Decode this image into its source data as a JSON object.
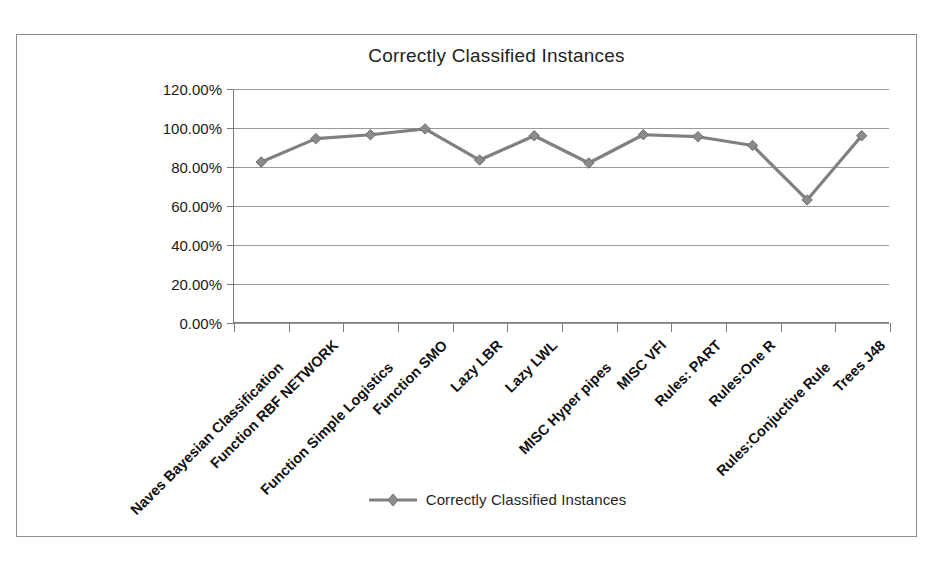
{
  "chart_data": {
    "type": "line",
    "title": "Correctly Classified Instances",
    "xlabel": "",
    "ylabel": "",
    "ylim": [
      0,
      120
    ],
    "ytick_values": [
      120,
      100,
      80,
      60,
      40,
      20,
      0
    ],
    "ytick_labels": [
      "120.00%",
      "100.00%",
      "80.00%",
      "60.00%",
      "40.00%",
      "20.00%",
      "0.00%"
    ],
    "grid": true,
    "legend_position": "bottom",
    "series_color": "#808080",
    "marker": "diamond",
    "categories": [
      "Naves Bayesian Classification",
      "Function RBF NETWORK",
      "Function Simple Logistics",
      "Function SMO",
      "Lazy LBR",
      "Lazy LWL",
      "MISC  Hyper pipes",
      "MISC VFI",
      "Rules: PART",
      "Rules:One R",
      "Rules:Conjuctive Rule",
      "Trees J48"
    ],
    "series": [
      {
        "name": "Correctly Classified Instances",
        "values": [
          82.5,
          94.5,
          96.5,
          99.5,
          83.5,
          96.0,
          82.0,
          96.5,
          95.5,
          91.0,
          63.0,
          96.0
        ]
      }
    ]
  },
  "legend": {
    "label": "Correctly Classified Instances"
  },
  "colors": {
    "series": "#808080",
    "axis": "#7c7c7c",
    "grid": "#9a9a9a",
    "frame": "#8d8d8d",
    "text": "#1a1a1a"
  }
}
